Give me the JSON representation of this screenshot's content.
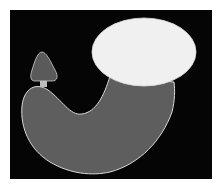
{
  "figure": {
    "colors": {
      "page_background": "#ffffff",
      "panel_background": "#050505",
      "body_fill": "#5e5e5e",
      "body_outline": "#d8d8d8",
      "cap_fill": "#f0f0f0",
      "lobe_fill": "#5a5a5a",
      "neck_fill": "#bdbdbd"
    },
    "parts": [
      {
        "name": "large-body",
        "shape": "J-shaped curved body"
      },
      {
        "name": "elliptical-cap",
        "shape": "ellipse"
      },
      {
        "name": "small-lobe",
        "shape": "rounded triangle"
      },
      {
        "name": "neck",
        "shape": "short connector"
      }
    ]
  }
}
